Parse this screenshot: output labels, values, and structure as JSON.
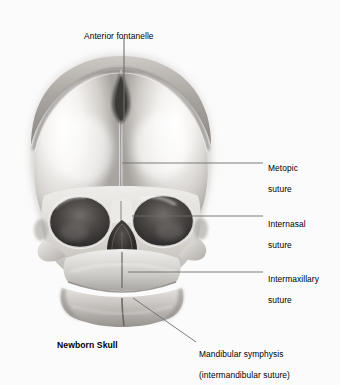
{
  "figure": {
    "title": "Newborn Skull",
    "view": "anterior view of neonatal cranium",
    "background_color": "#fbfbfb",
    "ink_color": "#000000",
    "leader_color": "#6e6e6e",
    "bone_light": "#f2f0ee",
    "bone_mid": "#bdbab6",
    "bone_dark": "#7d7a77",
    "cavity_dark": "#2e2c2b"
  },
  "labels": [
    {
      "id": "anterior-fontanelle",
      "text": "Anterior fontanelle",
      "line1": "Anterior fontanelle",
      "line2": "",
      "x": 84,
      "y": 20,
      "align": "left"
    },
    {
      "id": "metopic-suture",
      "text": "Metopic suture",
      "line1": "Metopic",
      "line2": "suture",
      "x": 268,
      "y": 152,
      "align": "left"
    },
    {
      "id": "internasal-suture",
      "text": "Internasal suture",
      "line1": "Internasal",
      "line2": "suture",
      "x": 268,
      "y": 208,
      "align": "left"
    },
    {
      "id": "intermaxillary-suture",
      "text": "Intermaxillary suture",
      "line1": "Intermaxillary",
      "line2": "suture",
      "x": 268,
      "y": 263,
      "align": "left"
    },
    {
      "id": "mandibular-symphysis",
      "text": "Mandibular symphysis (intermandibular suture)",
      "line1": "Mandibular symphysis",
      "line2": "(intermandibular suture)",
      "x": 199,
      "y": 338,
      "align": "left"
    }
  ],
  "caption": {
    "text": "Newborn Skull",
    "x": 57,
    "y": 340
  }
}
